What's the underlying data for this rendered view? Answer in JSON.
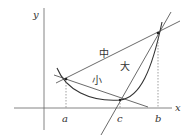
{
  "diagram": {
    "axes": {
      "x_label": "x",
      "y_label": "y"
    },
    "points": {
      "a_label": "a",
      "b_label": "b",
      "c_label": "c"
    },
    "lines": {
      "chord_ab_label": "中",
      "chord_ac_label": "小",
      "line_cb_label": "大"
    },
    "colors": {
      "stroke": "#444444",
      "axis": "#666666",
      "dashed": "#777777"
    }
  }
}
